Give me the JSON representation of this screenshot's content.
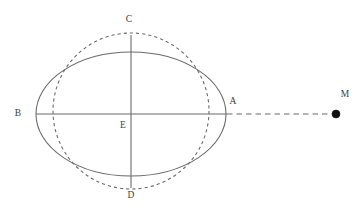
{
  "figure": {
    "name": "ellipse-circle-point-diagram",
    "background_color": "#ffffff",
    "stroke_color": "#6b6b6b",
    "label_color": "#3d3d3d",
    "point_fill_color": "#111111",
    "width": 358,
    "height": 216
  },
  "labels": {
    "a": "A",
    "b": "B",
    "c": "C",
    "d": "D",
    "e": "E",
    "m": "M"
  },
  "label_positions": {
    "a": {
      "x": 233,
      "y": 102
    },
    "b": {
      "x": 18,
      "y": 114
    },
    "c": {
      "x": 129,
      "y": 20
    },
    "d": {
      "x": 131,
      "y": 196
    },
    "e": {
      "x": 123,
      "y": 126
    },
    "m": {
      "x": 345,
      "y": 95
    }
  },
  "geometry": {
    "ellipse": {
      "style": "solid",
      "cx": 131,
      "cy": 114,
      "rx": 95,
      "ry": 62
    },
    "circle": {
      "style": "dashed",
      "cx": 131,
      "cy": 111,
      "r": 78
    },
    "major_axis_segment": {
      "style": "solid",
      "x1": 36,
      "y1": 114,
      "x2": 227,
      "y2": 114
    },
    "extension_segment": {
      "style": "dashed",
      "x1": 227,
      "y1": 114,
      "x2": 333,
      "y2": 114
    },
    "minor_axis_segment": {
      "style": "solid",
      "x1": 131,
      "y1": 35,
      "x2": 131,
      "y2": 188
    },
    "point_m": {
      "cx": 336,
      "cy": 114,
      "r": 4
    }
  }
}
